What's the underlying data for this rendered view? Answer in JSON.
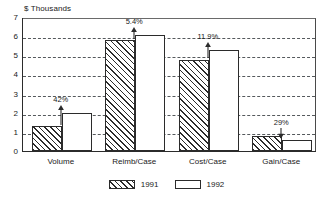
{
  "chart_data": {
    "type": "bar",
    "title": "",
    "subtitle": "",
    "xlabel": "",
    "ylabel": "$ Thousands",
    "ylim": [
      0,
      7
    ],
    "ytick_step": 1,
    "yticks": [
      "7",
      "6",
      "5",
      "4",
      "3",
      "2",
      "1",
      "0"
    ],
    "grid": true,
    "grid_style": "dashed-horizontal",
    "legend_position": "bottom-center",
    "categories": [
      "Volume",
      "Reimb/Case",
      "Cost/Case",
      "Gain/Case"
    ],
    "series": [
      {
        "name": "1991",
        "fill": "hatched",
        "values": [
          1.3,
          5.78,
          4.78,
          0.78
        ]
      },
      {
        "name": "1992",
        "fill": "white",
        "values": [
          2.0,
          6.05,
          5.27,
          0.58
        ]
      }
    ],
    "annotations": [
      {
        "category": "Volume",
        "text": "42%",
        "direction": "up"
      },
      {
        "category": "Reimb/Case",
        "text": "5.4%",
        "direction": "up"
      },
      {
        "category": "Cost/Case",
        "text": "11.9%",
        "direction": "up"
      },
      {
        "category": "Gain/Case",
        "text": "29%",
        "direction": "down"
      }
    ]
  },
  "colors": {
    "axis": "#2b2b2b",
    "grid": "#55595c",
    "bar_outline": "#2b2b2b",
    "hatch": "#2b2b2b",
    "background": "#ffffff"
  }
}
